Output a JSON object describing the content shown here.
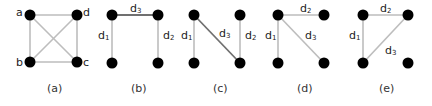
{
  "colors": {
    "node": "#000000",
    "edge_light": "#bdbdbd",
    "edge_dark": "#707070",
    "text": "#222222"
  },
  "panels": [
    {
      "id": "a",
      "caption": "(a)",
      "nodes": [
        {
          "name": "a",
          "x": 30,
          "y": 15,
          "label": "a"
        },
        {
          "name": "d",
          "x": 77,
          "y": 15,
          "label": "d"
        },
        {
          "name": "b",
          "x": 30,
          "y": 62,
          "label": "b"
        },
        {
          "name": "c",
          "x": 77,
          "y": 62,
          "label": "c"
        }
      ],
      "edges": [
        "a-d",
        "a-b",
        "d-c",
        "b-c",
        "a-c",
        "b-d"
      ]
    },
    {
      "id": "b",
      "caption": "(b)",
      "edges": [
        {
          "label": "d",
          "sub": "1",
          "from": "TL",
          "to": "BL"
        },
        {
          "label": "d",
          "sub": "2",
          "from": "TR",
          "to": "BR"
        },
        {
          "label": "d",
          "sub": "3",
          "from": "TL",
          "to": "TR",
          "dark": true
        }
      ]
    },
    {
      "id": "c",
      "caption": "(c)",
      "edges": [
        {
          "label": "d",
          "sub": "1",
          "from": "TL",
          "to": "BL"
        },
        {
          "label": "d",
          "sub": "2",
          "from": "TR",
          "to": "BR"
        },
        {
          "label": "d",
          "sub": "3",
          "from": "TL",
          "to": "BR",
          "dark": true
        }
      ]
    },
    {
      "id": "d",
      "caption": "(d)",
      "edges": [
        {
          "label": "d",
          "sub": "1",
          "from": "TL",
          "to": "BL"
        },
        {
          "label": "d",
          "sub": "2",
          "from": "TL",
          "to": "TR"
        },
        {
          "label": "d",
          "sub": "3",
          "from": "TL",
          "to": "BR"
        }
      ]
    },
    {
      "id": "e",
      "caption": "(e)",
      "edges": [
        {
          "label": "d",
          "sub": "1",
          "from": "TL",
          "to": "BL"
        },
        {
          "label": "d",
          "sub": "2",
          "from": "TL",
          "to": "TR"
        },
        {
          "label": "d",
          "sub": "3",
          "from": "BL",
          "to": "TR"
        }
      ]
    }
  ],
  "text": {
    "a_node": "a",
    "b_node": "b",
    "c_node": "c",
    "d_node": "d",
    "d": "d",
    "s1": "1",
    "s2": "2",
    "s3": "3",
    "cap_a": "(a)",
    "cap_b": "(b)",
    "cap_c": "(c)",
    "cap_d": "(d)",
    "cap_e": "(e)"
  }
}
